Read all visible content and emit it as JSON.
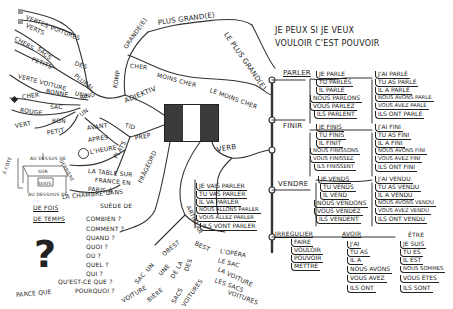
{
  "center": {
    "label": "French flag",
    "colors": [
      "#3a3a3a",
      "#ffffff",
      "#3a3a3a"
    ]
  },
  "motto": {
    "line1": "JE PEUX SI JE VEUX",
    "line2": "VOULOIR C'EST POUVOIR"
  },
  "adjektiv": {
    "label": "ADJEKTIV",
    "komp": {
      "label": "KOMP",
      "grande": [
        "GRANDE(E)",
        "PLUS GRAND(E)",
        "LE PLUS GRAND(E)"
      ],
      "cher": [
        "CHER",
        "MOINS CHER",
        "LE MOINS CHER"
      ]
    },
    "plural": {
      "label": "PLURAL",
      "items": [
        "DES",
        "VERTES VOITURES",
        "VERTS",
        "SACS",
        "CHERS",
        "PETITS"
      ]
    },
    "sing": {
      "label": "SING",
      "items": [
        "UNE",
        "VERTE VOITURE",
        "BONNE",
        "CHER",
        "UN",
        "SAC",
        "ROUGE",
        "VERT",
        "BON",
        "PETIT"
      ]
    }
  },
  "prep": {
    "label": "PREP",
    "tid": {
      "label": "TID",
      "items": [
        "AVANT",
        "APRÈS",
        "L'HEURE"
      ]
    },
    "plats": {
      "label": "PLATS",
      "items": [
        "LA TABLE SUR",
        "FRANCE EN",
        "PARIS À",
        "LA CHAMBRE DANS",
        "SUÈDE DE"
      ]
    },
    "drawing_labels": [
      "AU DESSUS DE",
      "SUR",
      "SOUS",
      "AU DESSOUS DE",
      "À CÔTÉ",
      "DERRIÈRE"
    ],
    "other": [
      "DE FOIS",
      "DE TEMPS"
    ]
  },
  "fragebord": {
    "label": "FRÅGEORD",
    "items": [
      "COMBIEN ?",
      "COMMENT ?",
      "QUAND ?",
      "QUOI ?",
      "OÙ ?",
      "QUEL ?",
      "QUI ?",
      "QU'EST-CE QUE ?",
      "POURQUOI ?"
    ],
    "answer": "PARCE QUE",
    "symbol": "?"
  },
  "artikular": {
    "label": "ARTIKLAR",
    "obest": {
      "label": "OBEST",
      "items": [
        "UN",
        "SAC",
        "UNE",
        "VOITURE",
        "DE LA",
        "BIÈRE",
        "DES",
        "SACS",
        "VOITURES"
      ]
    },
    "best": {
      "label": "BEST",
      "items": [
        "L'OPÉRA",
        "LE SAC",
        "LA VOITURE",
        "LES SACS",
        "VOITURES"
      ]
    }
  },
  "verb": {
    "label": "VERB",
    "future": [
      "JE VAIS PARLER",
      "TU VAS PARLER",
      "IL VA PARLER",
      "NOUS ALLONS PARLER",
      "VOUS ALLEZ PARLER",
      "ILS VONT PARLER"
    ],
    "parler": {
      "label": "PARLER",
      "present": [
        "JE PARLE",
        "TU PARLES",
        "IL PARLE",
        "NOUS PARLONS",
        "VOUS PARLEZ",
        "ILS PARLENT"
      ],
      "past": [
        "J'AI PARLÉ",
        "TU AS PARLÉ",
        "IL A PARLÉ",
        "NOUS AVONS PARLÉ",
        "VOUS AVEZ PARLÉ",
        "ILS ONT PARLÉ"
      ]
    },
    "finir": {
      "label": "FINIR",
      "present": [
        "JE FINIS",
        "TU FINIS",
        "IL FINIT",
        "NOUS FINISSONS",
        "VOUS FINISSEZ",
        "ILS FINISSENT"
      ],
      "past": [
        "J'AI FINI",
        "TU AS FINI",
        "IL A FINI",
        "NOUS AVONS FINI",
        "VOUS AVEZ FINI",
        "ILS ONT FINI"
      ]
    },
    "vendre": {
      "label": "VENDRE",
      "present": [
        "JE VENDS",
        "TU VENDS",
        "IL VEND",
        "NOUS VENDONS",
        "VOUS VENDEZ",
        "ILS VENDENT"
      ],
      "past": [
        "J'AI VENDU",
        "TU AS VENDU",
        "IL A VENDU",
        "NOUS AVONS VENDU",
        "VOUS AVEZ VENDU",
        "ILS ONT VENDU"
      ]
    },
    "irregulier": {
      "label": "IRREGULIER",
      "list": [
        "FAIRE",
        "VOULOIR",
        "POUVOIR",
        "METTRE"
      ],
      "avoir": {
        "label": "AVOIR",
        "items": [
          "J'AI",
          "TU AS",
          "IL A",
          "NOUS AVONS",
          "VOUS AVEZ",
          "ILS ONT"
        ]
      },
      "etre": {
        "label": "ÊTRE",
        "items": [
          "JE SUIS",
          "TU ES",
          "IL EST",
          "NOUS SOMMES",
          "VOUS ÊTES",
          "ILS SONT"
        ]
      }
    }
  }
}
